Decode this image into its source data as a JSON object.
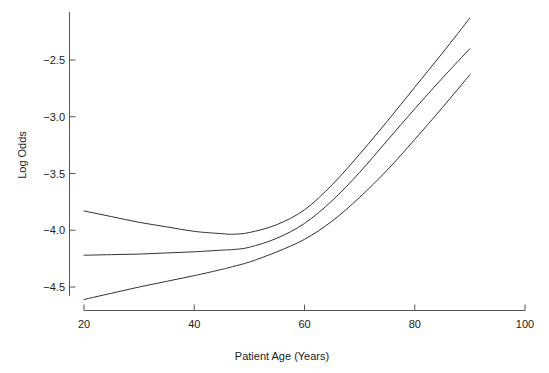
{
  "chart_data": {
    "type": "line",
    "title": "",
    "xlabel": "Patient Age (Years)",
    "ylabel": "Log Odds",
    "xlim": [
      20,
      100
    ],
    "ylim": [
      -4.72,
      -2.05
    ],
    "grid": false,
    "legend": "none",
    "xticks": [
      20,
      40,
      60,
      80,
      100
    ],
    "xtick_labels": [
      "20",
      "40",
      "60",
      "80",
      "100"
    ],
    "yticks": [
      -2.5,
      -3.0,
      -3.5,
      -4.0,
      -4.5
    ],
    "ytick_labels": [
      "−2.5",
      "−3.0",
      "−3.5",
      "−4.0",
      "−4.5"
    ],
    "line_color": "#333333",
    "line_width": 1,
    "x": [
      20,
      25,
      30,
      35,
      40,
      45,
      47,
      50,
      55,
      60,
      65,
      70,
      75,
      80,
      85,
      90
    ],
    "series": [
      {
        "name": "upper-confidence-band",
        "role": "upper",
        "values": [
          -3.83,
          -3.88,
          -3.93,
          -3.97,
          -4.01,
          -4.03,
          -4.035,
          -4.02,
          -3.95,
          -3.82,
          -3.6,
          -3.33,
          -3.04,
          -2.74,
          -2.44,
          -2.13
        ]
      },
      {
        "name": "fitted-estimate",
        "role": "center",
        "values": [
          -4.22,
          -4.215,
          -4.21,
          -4.2,
          -4.19,
          -4.175,
          -4.17,
          -4.15,
          -4.07,
          -3.94,
          -3.74,
          -3.49,
          -3.21,
          -2.93,
          -2.66,
          -2.4
        ]
      },
      {
        "name": "lower-confidence-band",
        "role": "lower",
        "values": [
          -4.61,
          -4.555,
          -4.5,
          -4.45,
          -4.4,
          -4.345,
          -4.32,
          -4.28,
          -4.19,
          -4.08,
          -3.92,
          -3.71,
          -3.47,
          -3.2,
          -2.92,
          -2.63
        ]
      }
    ]
  }
}
